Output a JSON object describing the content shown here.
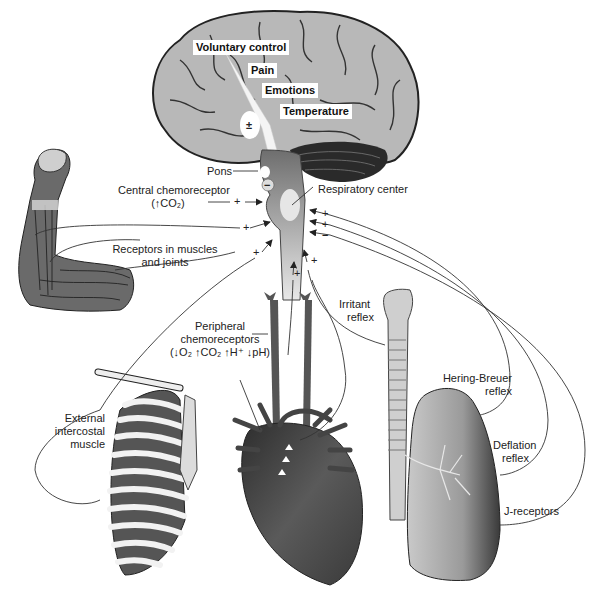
{
  "diagram": {
    "brain_labels": [
      {
        "id": "voluntary",
        "text": "Voluntary control"
      },
      {
        "id": "pain",
        "text": "Pain"
      },
      {
        "id": "emotions",
        "text": "Emotions"
      },
      {
        "id": "temperature",
        "text": "Temperature"
      }
    ],
    "brain_sign": "±",
    "pons": {
      "label": "Pons",
      "sign": "−"
    },
    "respiratory_center": "Respiratory center",
    "central_chemoreceptor": {
      "line1": "Central chemoreceptor",
      "line2": "(↑CO₂)",
      "sign": "+"
    },
    "muscle_receptors": {
      "line1": "Receptors in muscles",
      "line2": "and joints",
      "signs": [
        "+",
        "+"
      ]
    },
    "peripheral_chemoreceptors": {
      "line1": "Peripheral",
      "line2": "chemoreceptors",
      "line3": "(↓O₂  ↑CO₂  ↑H⁺  ↓pH)",
      "sign": "+"
    },
    "external_intercostal": {
      "line1": "External",
      "line2": "intercostal",
      "line3": "muscle",
      "sign": "+"
    },
    "irritant_reflex": {
      "line1": "Irritant",
      "line2": "reflex",
      "sign": "+"
    },
    "hering_breuer": {
      "line1": "Hering-Breuer",
      "line2": "reflex",
      "sign": "−"
    },
    "deflation_reflex": {
      "line1": "Deflation",
      "line2": "reflex",
      "sign": "+"
    },
    "j_receptors": {
      "label": "J-receptors",
      "sign": "+"
    },
    "colors": {
      "brain_fill": "#b8b8b8",
      "cerebellum": "#2a2a2a",
      "brainstem": "#7a7a7a",
      "heart": "#4a4a4a",
      "lung": "#8c8c8c",
      "rib_muscle": "#555555",
      "line": "#333333"
    }
  }
}
